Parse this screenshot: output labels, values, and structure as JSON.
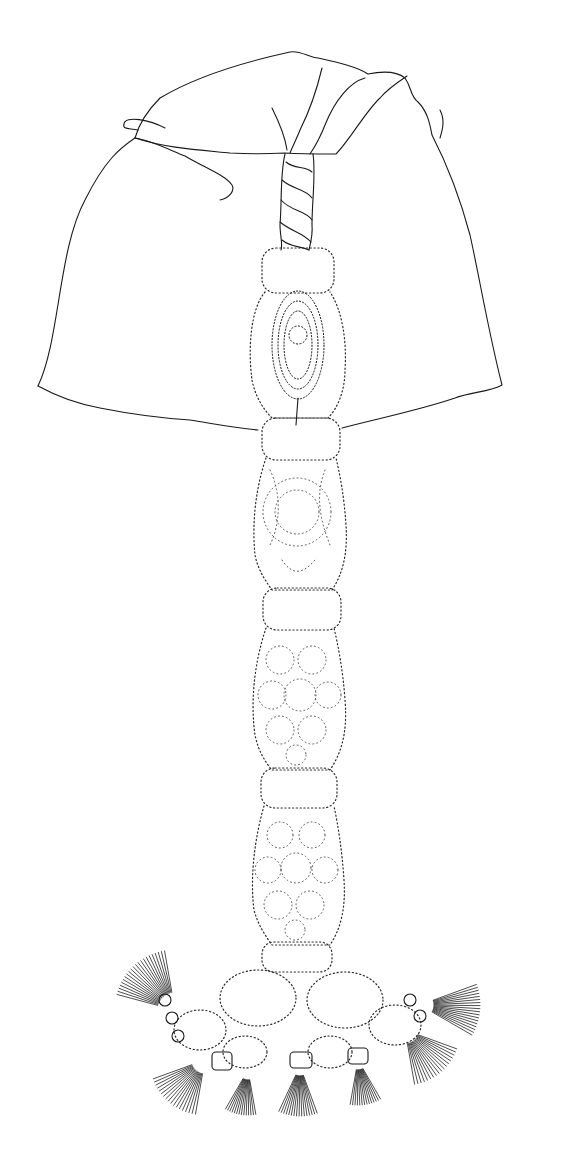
{
  "illustration": {
    "subject": "siphonophore line drawing",
    "style": "black ink on white",
    "colors": {
      "background": "#ffffff",
      "ink": "#1a1a1a"
    },
    "parts": [
      {
        "name": "nectophore-bell",
        "type": "solid-outline"
      },
      {
        "name": "twisted-stem",
        "type": "spiral-rope"
      },
      {
        "name": "stem-segments",
        "count": 4,
        "type": "dotted-outline"
      },
      {
        "name": "gonophore-cluster-dark",
        "type": "stippled-dark"
      },
      {
        "name": "tentacle-fringe",
        "type": "radiating-lines"
      }
    ]
  }
}
